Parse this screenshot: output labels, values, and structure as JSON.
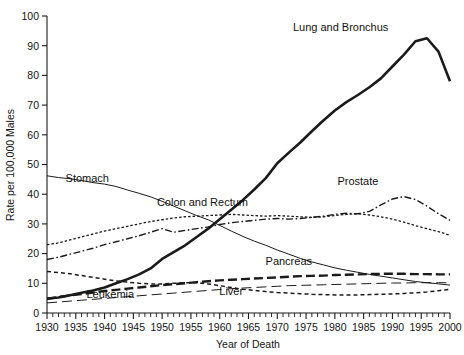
{
  "chart_data": {
    "type": "line",
    "title": "",
    "xlabel": "Year of Death",
    "ylabel": "Rate per 100,000 Males",
    "xlim": [
      1930,
      2000
    ],
    "ylim": [
      0,
      100
    ],
    "ytick_step": 10,
    "xtick_step": 5,
    "minor_xtick_step": 1,
    "grid": false,
    "legend_position": "inline-annotations",
    "yticks": [
      0,
      10,
      20,
      30,
      40,
      50,
      60,
      70,
      80,
      90,
      100
    ],
    "xticks": [
      1930,
      1935,
      1940,
      1945,
      1950,
      1955,
      1960,
      1965,
      1970,
      1975,
      1980,
      1985,
      1990,
      1995,
      2000
    ],
    "x": [
      1930,
      1932,
      1934,
      1936,
      1938,
      1940,
      1942,
      1944,
      1946,
      1948,
      1950,
      1952,
      1954,
      1956,
      1958,
      1960,
      1962,
      1964,
      1966,
      1968,
      1970,
      1972,
      1974,
      1976,
      1978,
      1980,
      1982,
      1984,
      1986,
      1988,
      1990,
      1992,
      1994,
      1996,
      1998,
      2000
    ],
    "series": [
      {
        "name": "Lung and Bronchus",
        "style": "solid-thick",
        "label_x": 1981,
        "label_y": 95,
        "values": [
          4.8,
          5.2,
          6.0,
          6.8,
          7.6,
          8.6,
          10.0,
          11.4,
          13.0,
          15.0,
          18.2,
          20.5,
          22.8,
          25.6,
          28.4,
          31.6,
          34.8,
          38.0,
          41.6,
          45.4,
          50.4,
          54.0,
          57.4,
          61.2,
          64.8,
          68.2,
          71.0,
          73.4,
          76.0,
          79.0,
          83.0,
          87.0,
          91.5,
          92.5,
          88.0,
          78.0
        ]
      },
      {
        "name": "Stomach",
        "style": "solid-thin",
        "label_x": 1937,
        "label_y": 44,
        "values": [
          46.2,
          45.6,
          45.2,
          44.6,
          43.9,
          43.4,
          42.6,
          41.4,
          40.3,
          39.1,
          37.6,
          36.0,
          34.4,
          32.8,
          31.4,
          29.5,
          27.6,
          25.8,
          24.2,
          22.8,
          21.2,
          19.8,
          18.4,
          17.2,
          16.2,
          15.2,
          14.4,
          13.7,
          13.0,
          12.4,
          11.8,
          11.2,
          10.6,
          10.2,
          9.8,
          9.4
        ]
      },
      {
        "name": "Colon and Rectum",
        "style": "dotted",
        "label_x": 1957,
        "label_y": 36,
        "values": [
          23.0,
          23.6,
          24.6,
          25.6,
          26.6,
          27.6,
          28.4,
          29.2,
          30.0,
          30.8,
          31.4,
          32.0,
          32.4,
          32.6,
          32.8,
          33.0,
          33.2,
          33.0,
          32.8,
          32.6,
          32.8,
          32.6,
          32.4,
          32.2,
          32.4,
          32.8,
          33.2,
          33.4,
          33.0,
          32.4,
          31.6,
          30.6,
          29.4,
          28.4,
          27.4,
          26.2
        ]
      },
      {
        "name": "Prostate",
        "style": "dash-dot",
        "label_x": 1984,
        "label_y": 43,
        "values": [
          18.0,
          18.8,
          19.8,
          20.8,
          21.8,
          23.0,
          24.0,
          25.0,
          26.0,
          27.2,
          28.4,
          27.2,
          27.8,
          28.4,
          29.0,
          29.8,
          30.4,
          30.8,
          31.2,
          31.6,
          31.8,
          31.6,
          31.8,
          32.2,
          32.6,
          33.2,
          33.6,
          33.4,
          34.2,
          36.4,
          38.4,
          39.2,
          38.2,
          36.0,
          33.4,
          31.2
        ]
      },
      {
        "name": "Pancreas",
        "style": "long-dash-thick",
        "label_x": 1972,
        "label_y": 16,
        "values": [
          4.8,
          5.4,
          5.9,
          6.4,
          6.9,
          7.4,
          7.8,
          8.2,
          8.6,
          9.0,
          9.4,
          9.7,
          10.0,
          10.4,
          10.7,
          11.0,
          11.2,
          11.4,
          11.6,
          11.8,
          12.0,
          12.2,
          12.4,
          12.5,
          12.6,
          12.8,
          12.9,
          13.0,
          13.1,
          13.2,
          13.2,
          13.2,
          13.1,
          13.1,
          13.0,
          13.0
        ]
      },
      {
        "name": "Liver",
        "style": "short-dash",
        "label_x": 1962,
        "label_y": 6,
        "values": [
          14.0,
          13.6,
          13.2,
          12.6,
          12.0,
          11.4,
          10.8,
          10.4,
          10.0,
          9.8,
          9.8,
          10.0,
          10.2,
          10.2,
          9.8,
          9.2,
          8.6,
          8.0,
          7.6,
          7.2,
          6.9,
          6.7,
          6.5,
          6.3,
          6.2,
          6.1,
          6.1,
          6.1,
          6.2,
          6.3,
          6.4,
          6.6,
          6.8,
          7.1,
          7.5,
          8.0
        ]
      },
      {
        "name": "Leukemia",
        "style": "long-dash-thin",
        "label_x": 1941,
        "label_y": 5,
        "values": [
          3.4,
          3.7,
          4.0,
          4.3,
          4.6,
          4.9,
          5.2,
          5.5,
          5.8,
          6.1,
          6.4,
          6.7,
          7.0,
          7.3,
          7.6,
          7.9,
          8.2,
          8.4,
          8.6,
          8.8,
          9.0,
          9.2,
          9.3,
          9.4,
          9.5,
          9.6,
          9.7,
          9.8,
          9.9,
          10.0,
          10.1,
          10.1,
          10.2,
          10.2,
          10.2,
          10.2
        ]
      }
    ]
  },
  "colors": {
    "ink": "#1a1a1a",
    "background": "#ffffff"
  }
}
